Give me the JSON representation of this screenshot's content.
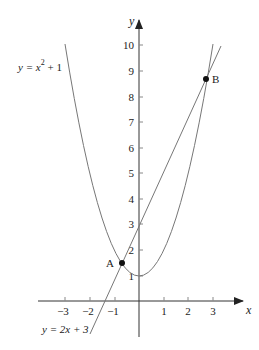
{
  "diagram": {
    "type": "coordinate-graph",
    "axes": {
      "x_label": "x",
      "y_label": "y",
      "x_ticks": [
        "−3",
        "−2",
        "−1",
        "1",
        "2",
        "3"
      ],
      "y_ticks": [
        "1",
        "2",
        "3",
        "4",
        "5",
        "6",
        "7",
        "8",
        "9",
        "10"
      ]
    },
    "curves": [
      {
        "name": "parabola",
        "label": "y = x² + 1",
        "label_parts": [
          "y = x",
          "2",
          " + 1"
        ]
      },
      {
        "name": "line",
        "label": "y = 2x + 3"
      }
    ],
    "points": [
      {
        "name": "A",
        "label": "A",
        "x": -0.73,
        "y": 1.54
      },
      {
        "name": "B",
        "label": "B",
        "x": 2.73,
        "y": 8.46
      }
    ],
    "colors": {
      "axis": "#222222",
      "curve": "#777777",
      "point": "#111111"
    }
  }
}
